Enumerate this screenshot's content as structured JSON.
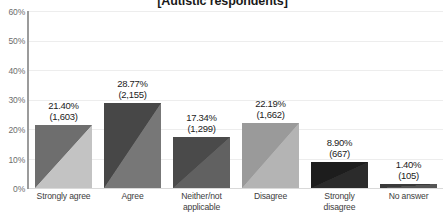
{
  "chart_data": {
    "type": "bar",
    "title": "[Autistic respondents]",
    "xlabel": "",
    "ylabel": "",
    "ylim": [
      0,
      60
    ],
    "ytick_labels": [
      "60%",
      "50%",
      "40%",
      "30%",
      "20%",
      "10%",
      "0%"
    ],
    "ytick_values": [
      60,
      50,
      40,
      30,
      20,
      10,
      0
    ],
    "grid": true,
    "legend": "none",
    "categories": [
      "Strongly agree",
      "Agree",
      "Neither/not applicable",
      "Disagree",
      "Strongly disagree",
      "No answer"
    ],
    "category_lines": [
      [
        "Strongly agree"
      ],
      [
        "Agree"
      ],
      [
        "Neither/not",
        "applicable"
      ],
      [
        "Disagree"
      ],
      [
        "Strongly",
        "disagree"
      ],
      [
        "No answer"
      ]
    ],
    "values": [
      21.4,
      28.77,
      17.34,
      22.19,
      8.9,
      1.4
    ],
    "counts": [
      1603,
      2155,
      1299,
      1662,
      667,
      105
    ],
    "value_labels": [
      "21.40%",
      "28.77%",
      "17.34%",
      "22.19%",
      "8.90%",
      "1.40%"
    ],
    "count_labels": [
      "(1,603)",
      "(2,155)",
      "(1,299)",
      "(1,662)",
      "(667)",
      "(105)"
    ],
    "bar_colors_dark": [
      "#6e6e6e",
      "#474747",
      "#4a4a4a",
      "#9a9a9a",
      "#1d1d1d",
      "#3a3a3a"
    ],
    "bar_colors_light": [
      "#c3c3c3",
      "#777777",
      "#616161",
      "#b4b4b4",
      "#2b2b2b",
      "#555555"
    ],
    "axis_color": "#9b9b9b",
    "gridline_color": "#ededed",
    "label_text_color": "#1c1c1c",
    "tick_text_color": "#6d6d6d"
  }
}
